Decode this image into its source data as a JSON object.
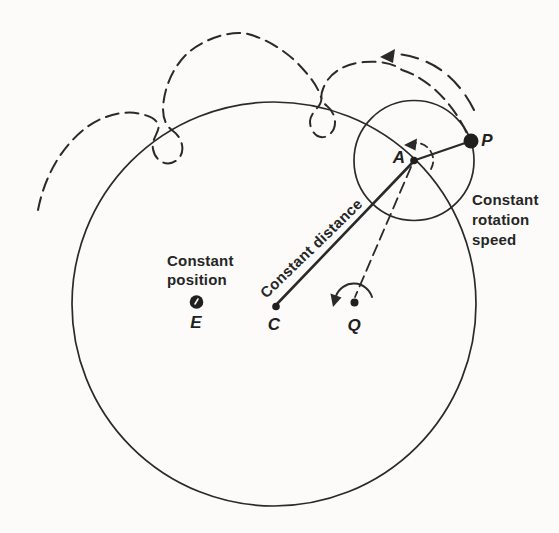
{
  "figure": {
    "title_hint": "Ptolemaic deferent and epicycle diagram",
    "ink_color": "#262626",
    "background": "#fcfbf9",
    "annotations": {
      "constant_position": "Constant\nposition",
      "constant_distance": "Constant distance",
      "constant_rotation": "Constant\nrotation\nspeed"
    },
    "points": {
      "E": "E",
      "C": "C",
      "Q": "Q",
      "A": "A",
      "P": "P"
    }
  }
}
